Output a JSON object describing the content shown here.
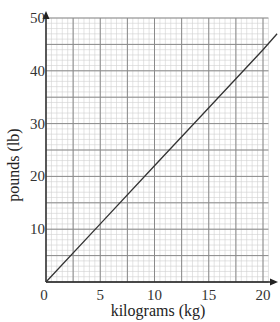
{
  "chart_data": {
    "type": "line",
    "title": "",
    "xlabel": "kilograms (kg)",
    "ylabel": "pounds (lb)",
    "xlim": [
      0,
      20.5
    ],
    "ylim": [
      0,
      50
    ],
    "x_ticks": [
      0,
      5,
      10,
      15,
      20
    ],
    "y_ticks": [
      10,
      20,
      30,
      40,
      50
    ],
    "x_tick_labels": [
      "0",
      "5",
      "10",
      "15",
      "20"
    ],
    "y_tick_labels": [
      "10",
      "20",
      "30",
      "40",
      "50"
    ],
    "grid": true,
    "grid_major_x": 2.5,
    "grid_major_y": 5,
    "grid_minor_x": 0.5,
    "grid_minor_y": 1,
    "legend": null,
    "series": [
      {
        "name": "pounds vs kilograms",
        "x": [
          0,
          5,
          10,
          15,
          20,
          21.3
        ],
        "y": [
          0,
          11,
          22,
          33,
          44,
          47
        ]
      }
    ],
    "colors": {
      "line": "#333333",
      "major_grid": "#8a8a8a",
      "minor_grid": "#d0d0d0",
      "axis": "#222222"
    }
  }
}
